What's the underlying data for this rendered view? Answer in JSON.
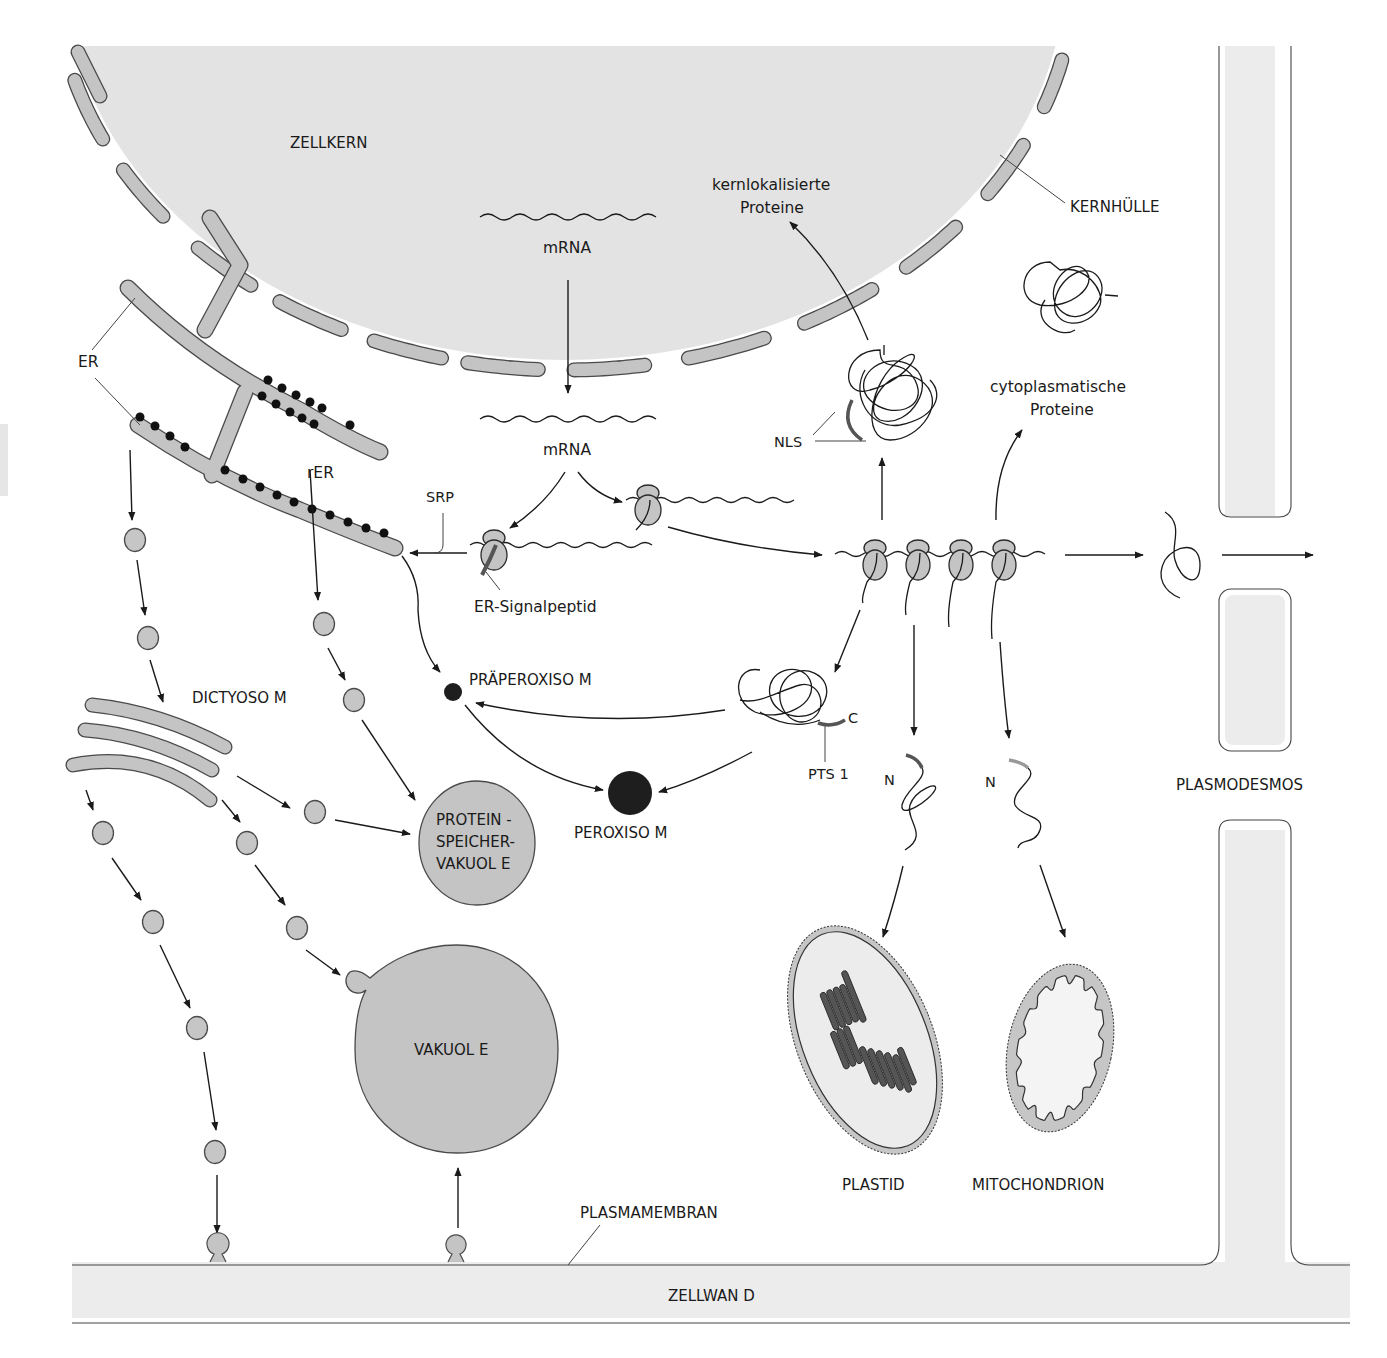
{
  "diagram": {
    "colors": {
      "nucleus": "#e3e3e3",
      "membrane": "#c4c4c4",
      "outline": "#4a4a4a",
      "cell_wall": "#ececec",
      "peroxisome": "#1e1e1e",
      "thylakoid": "#555555"
    },
    "labels": {
      "zellkern": "ZELLKERN",
      "kernhuelle": "KERNHÜLLE",
      "mrna_nucleus": "mRNA",
      "mrna_cytosol": "mRNA",
      "er": "ER",
      "rer": "rER",
      "srp": "SRP",
      "er_signalpeptid": "ER-Signalpeptid",
      "kernlokalisierte_1": "kernlokalisierte",
      "kernlokalisierte_2": "Proteine",
      "nls": "NLS",
      "cytoplasmatische_1": "cytoplasmatische",
      "cytoplasmatische_2": "Proteine",
      "dictyosom": "DICTYOSO M",
      "praeperoxisom": "PRÄPEROXISO M",
      "peroxisom": "PEROXISO M",
      "pts1": "PTS 1",
      "c_terminus": "C",
      "n_terminus_plastid": "N",
      "n_terminus_mito": "N",
      "proteinspeicher_1": "PROTEIN -",
      "proteinspeicher_2": "SPEICHER-",
      "proteinspeicher_3": "VAKUOL E",
      "vakuole": "VAKUOL E",
      "plastid": "PLASTID",
      "mitochondrion": "MITOCHONDRION",
      "plasmodesmos": "PLASMODESMOS",
      "plasmamembran": "PLASMAMEMBRAN",
      "zellwand": "ZELLWAN D"
    },
    "nodes": [
      {
        "id": "zellkern",
        "label": "ZELLKERN"
      },
      {
        "id": "er",
        "label": "ER"
      },
      {
        "id": "rer",
        "label": "rER"
      },
      {
        "id": "dictyosom",
        "label": "DICTYOSOM"
      },
      {
        "id": "proteinspeichervakuole",
        "label": "PROTEINSPEICHERVAKUOLE"
      },
      {
        "id": "vakuole",
        "label": "VAKUOLE"
      },
      {
        "id": "praeperoxisom",
        "label": "PRÄPEROXISOM"
      },
      {
        "id": "peroxisom",
        "label": "PEROXISOM"
      },
      {
        "id": "plastid",
        "label": "PLASTID"
      },
      {
        "id": "mitochondrion",
        "label": "MITOCHONDRION"
      },
      {
        "id": "plasmodesmos",
        "label": "PLASMODESMOS"
      },
      {
        "id": "plasmamembran",
        "label": "PLASMAMEMBRAN"
      }
    ],
    "edges": [
      {
        "from": "mrna_nucleus",
        "to": "mrna_cytosol"
      },
      {
        "from": "mrna_cytosol",
        "to": "er_ribosome"
      },
      {
        "from": "mrna_cytosol",
        "to": "free_ribosome"
      },
      {
        "from": "er_ribosome",
        "to": "rer",
        "label": "SRP"
      },
      {
        "from": "free_ribosome",
        "to": "polysome"
      },
      {
        "from": "polysome",
        "to": "kernlokalisierte_proteine"
      },
      {
        "from": "polysome",
        "to": "cytoplasmatische_proteine"
      },
      {
        "from": "polysome",
        "to": "plasmodesmos"
      },
      {
        "from": "polysome",
        "to": "pts1_protein"
      },
      {
        "from": "polysome",
        "to": "plastid"
      },
      {
        "from": "polysome",
        "to": "mitochondrion"
      },
      {
        "from": "rer",
        "to": "praeperoxisom"
      },
      {
        "from": "pts1_protein",
        "to": "praeperoxisom"
      },
      {
        "from": "pts1_protein",
        "to": "peroxisom"
      },
      {
        "from": "praeperoxisom",
        "to": "peroxisom"
      },
      {
        "from": "er",
        "to": "dictyosom"
      },
      {
        "from": "rer",
        "to": "proteinspeichervakuole"
      },
      {
        "from": "dictyosom",
        "to": "proteinspeichervakuole"
      },
      {
        "from": "dictyosom",
        "to": "vakuole"
      },
      {
        "from": "dictyosom",
        "to": "plasmamembran"
      },
      {
        "from": "plasmamembran",
        "to": "vakuole"
      }
    ]
  }
}
